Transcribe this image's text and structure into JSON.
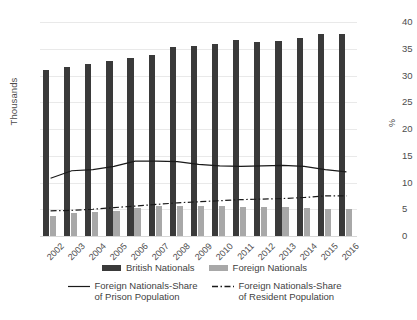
{
  "chart_data": {
    "type": "bar",
    "title": "",
    "xlabel": "",
    "ylabel": "Thousands",
    "y2label": "%",
    "ylim": [
      0,
      80
    ],
    "y2lim": [
      0,
      40
    ],
    "yticks": [
      0,
      10,
      20,
      30,
      40,
      50,
      60,
      70,
      80
    ],
    "y2ticks": [
      0,
      5,
      10,
      15,
      20,
      25,
      30,
      35,
      40
    ],
    "grid": true,
    "legend_position": "bottom",
    "categories": [
      "2002",
      "2003",
      "2004",
      "2005",
      "2006",
      "2007",
      "2008",
      "2009",
      "2010",
      "2011",
      "2012",
      "2013",
      "2014",
      "2015",
      "2016"
    ],
    "series": [
      {
        "name": "British Nationals",
        "type": "bar",
        "axis": "left",
        "color": "#3a3a3a",
        "values": [
          62.0,
          63.2,
          64.2,
          65.5,
          66.4,
          67.8,
          70.8,
          71.2,
          71.8,
          73.2,
          72.4,
          72.8,
          74.2,
          75.6,
          75.4
        ]
      },
      {
        "name": "Foreign Nationals",
        "type": "bar",
        "axis": "left",
        "color": "#a8a8a8",
        "values": [
          7.5,
          8.6,
          8.8,
          9.4,
          10.6,
          11.2,
          11.4,
          11.2,
          11.2,
          11.0,
          10.8,
          10.8,
          10.4,
          10.2,
          10.2
        ]
      },
      {
        "name": "Foreign Nationals-Share of Prison Population",
        "type": "line",
        "axis": "right",
        "style": "solid",
        "color": "#1a1a1a",
        "values": [
          10.8,
          12.2,
          12.4,
          13.0,
          14.0,
          14.0,
          13.9,
          13.4,
          13.1,
          13.0,
          13.1,
          13.2,
          13.0,
          12.4,
          12.0
        ]
      },
      {
        "name": "Foreign Nationals-Share of Resident Population",
        "type": "line",
        "axis": "right",
        "style": "dash-dot",
        "color": "#1a1a1a",
        "values": [
          4.7,
          4.8,
          5.0,
          5.3,
          5.6,
          5.9,
          6.2,
          6.4,
          6.6,
          6.8,
          6.9,
          7.0,
          7.2,
          7.5,
          7.5
        ]
      }
    ]
  },
  "axes": {
    "left_title": "Thousands",
    "right_title": "%",
    "left_ticks": [
      "0",
      "10",
      "20",
      "30",
      "40",
      "50",
      "60",
      "70",
      "80"
    ],
    "right_ticks": [
      "0",
      "5",
      "10",
      "15",
      "20",
      "25",
      "30",
      "35",
      "40"
    ],
    "x_labels": [
      "2002",
      "2003",
      "2004",
      "2005",
      "2006",
      "2007",
      "2008",
      "2009",
      "2010",
      "2011",
      "2012",
      "2013",
      "2014",
      "2015",
      "2016"
    ]
  },
  "legend": {
    "row1": [
      {
        "label": "British Nationals",
        "swatch": "dark"
      },
      {
        "label": "Foreign Nationals",
        "swatch": "light"
      }
    ],
    "row2": [
      {
        "label_line1": "Foreign Nationals-Share",
        "label_line2": "of Prison Population",
        "style": "solid"
      },
      {
        "label_line1": "Foreign Nationals-Share",
        "label_line2": "of Resident Population",
        "style": "dash-dot"
      }
    ]
  }
}
